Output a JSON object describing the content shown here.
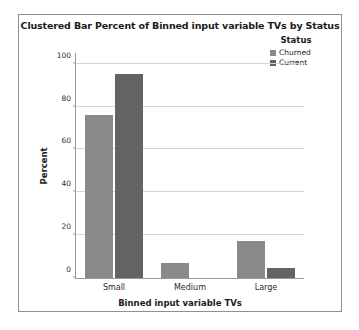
{
  "chart_data": {
    "type": "bar",
    "title": "Clustered Bar Percent of Binned input variable TVs by Status",
    "xlabel": "Binned input variable TVs",
    "ylabel": "Percent",
    "categories": [
      "Small",
      "Medium",
      "Large"
    ],
    "series": [
      {
        "name": "Churned",
        "values": [
          76,
          7,
          17.5
        ],
        "color": "#8a8a8a"
      },
      {
        "name": "Current",
        "values": [
          95,
          0,
          4.5
        ],
        "color": "#636363"
      }
    ],
    "legend_title": "Status",
    "legend_position": "right",
    "ylim": [
      0,
      105
    ],
    "yticks": [
      0,
      20,
      40,
      60,
      80,
      100
    ],
    "ytick_labels": [
      "0",
      "20",
      "40",
      "60",
      "80",
      "100"
    ],
    "grid": true,
    "grid_axis": "y"
  },
  "frame": {
    "border_color": "#8f8f8f",
    "background": "#ffffff"
  }
}
